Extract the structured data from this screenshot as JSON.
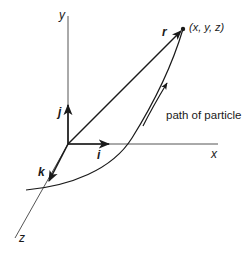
{
  "diagram": {
    "type": "3d-coordinate-system-particle-path",
    "axes": {
      "x": {
        "label": "x"
      },
      "y": {
        "label": "y"
      },
      "z": {
        "label": "z"
      }
    },
    "unit_vectors": {
      "i": {
        "label": "i"
      },
      "j": {
        "label": "j"
      },
      "k": {
        "label": "k"
      }
    },
    "position_vector": {
      "label": "r"
    },
    "point": {
      "label": "(x, y, z)"
    },
    "path": {
      "label": "path of particle"
    },
    "colors": {
      "line": "#1a1a1a",
      "background": "#ffffff"
    }
  }
}
